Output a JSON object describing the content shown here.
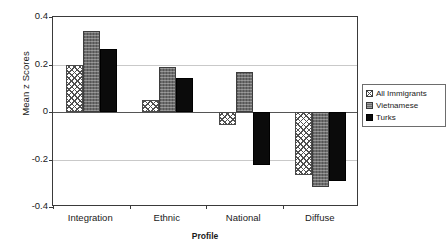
{
  "chart_data": {
    "type": "bar",
    "title": "",
    "xlabel": "Profile",
    "ylabel": "Mean z Scores",
    "categories": [
      "Integration",
      "Ethnic",
      "National",
      "Diffuse"
    ],
    "ylim": [
      -0.4,
      0.4
    ],
    "yticks": [
      0.4,
      0.2,
      0,
      -0.2,
      -0.4
    ],
    "ytick_labels": [
      "0.4",
      "0.2",
      "0",
      "-0.2",
      "-0.4"
    ],
    "grid": true,
    "legend_position": "right",
    "series": [
      {
        "name": "All Immigrants",
        "pattern": "crosshatch-light",
        "color": "#ffffff",
        "values": [
          0.2,
          0.05,
          -0.055,
          -0.265
        ]
      },
      {
        "name": "Vietnamese",
        "pattern": "speckled-gray",
        "color": "#6d6d6d",
        "values": [
          0.34,
          0.19,
          0.17,
          -0.315
        ]
      },
      {
        "name": "Turks",
        "pattern": "solid-black",
        "color": "#0b0b0b",
        "values": [
          0.265,
          0.145,
          -0.225,
          -0.29
        ]
      }
    ]
  }
}
